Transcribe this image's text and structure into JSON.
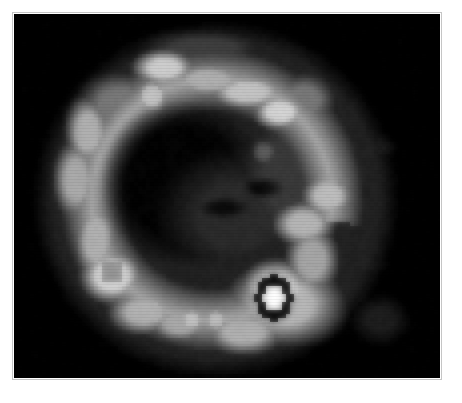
{
  "viewer": {
    "width": 462,
    "height": 403,
    "background_color": "#ffffff",
    "image_area": {
      "x": 14,
      "y": 14,
      "width": 426,
      "height": 364,
      "background_color": "#000000",
      "border_color": "#969696"
    }
  },
  "scan": {
    "modality_appearance": "grayscale nuclear medicine tomographic slice",
    "colormap": "grayscale",
    "pattern": "ring / horseshoe shaped uptake with cold center and focal hotspot",
    "pixelation": "blocky low-resolution interpolation",
    "intensity_levels": {
      "background": "#000000",
      "faint": "#1d1d1d",
      "low": "#3a3a3a",
      "mid": "#6e6e6e",
      "high": "#a9a9a9",
      "bright": "#d2d2d2",
      "peak": "#ffffff",
      "cold_core": "#050505"
    },
    "render": {
      "grid_cols": 107,
      "grid_rows": 91,
      "cell_px": 4,
      "blur_px": 3.2,
      "noise_amplitude": 7
    },
    "field": {
      "comment": "Radial/blob model describing the grayscale intensity field. Values in grid-cell coordinates of a 107x91 sampling grid.",
      "base_level": 0,
      "body_mask": {
        "cx": 50,
        "cy": 46,
        "rx": 41,
        "ry": 40,
        "edge_softness": 5,
        "level": 34
      },
      "ring": {
        "cx": 49,
        "cy": 46,
        "radius": 30,
        "thickness": 9,
        "level": 168,
        "arc_start_deg": 60,
        "arc_end_deg": 430,
        "gap_start_deg": 10,
        "gap_end_deg": 55
      },
      "cold_center": {
        "cx": 42,
        "cy": 42,
        "rx": 21,
        "ry": 21,
        "level": 4
      },
      "blobs": [
        {
          "name": "upper-left-arc",
          "cx": 26,
          "cy": 22,
          "rx": 9,
          "ry": 7,
          "level": 120
        },
        {
          "name": "top-left-bright",
          "cx": 37,
          "cy": 13,
          "rx": 7,
          "ry": 4,
          "level": 205
        },
        {
          "name": "top-small-bright",
          "cx": 34,
          "cy": 20,
          "rx": 4,
          "ry": 4,
          "level": 195
        },
        {
          "name": "top-center-band",
          "cx": 48,
          "cy": 16,
          "rx": 9,
          "ry": 4,
          "level": 175
        },
        {
          "name": "top-right-arc",
          "cx": 58,
          "cy": 19,
          "rx": 9,
          "ry": 4,
          "level": 196
        },
        {
          "name": "top-right-focus",
          "cx": 66,
          "cy": 24,
          "rx": 6,
          "ry": 4,
          "level": 212
        },
        {
          "name": "top-right-spread",
          "cx": 72,
          "cy": 21,
          "rx": 7,
          "ry": 6,
          "level": 120
        },
        {
          "name": "upper-canopy",
          "cx": 47,
          "cy": 8,
          "rx": 14,
          "ry": 4,
          "level": 62
        },
        {
          "name": "left-arc-upper",
          "cx": 18,
          "cy": 29,
          "rx": 5,
          "ry": 8,
          "level": 176
        },
        {
          "name": "left-arc-mid",
          "cx": 15,
          "cy": 41,
          "rx": 5,
          "ry": 9,
          "level": 170
        },
        {
          "name": "left-arc-lower",
          "cx": 20,
          "cy": 56,
          "rx": 5,
          "ry": 9,
          "level": 176
        },
        {
          "name": "left-hot-ring",
          "cx": 24,
          "cy": 65,
          "rx": 7,
          "ry": 6,
          "level": 215
        },
        {
          "name": "left-hot-ring-core",
          "cx": 24,
          "cy": 64,
          "rx": 3,
          "ry": 3,
          "level": 150
        },
        {
          "name": "lower-left-arc",
          "cx": 32,
          "cy": 74,
          "rx": 8,
          "ry": 5,
          "level": 178
        },
        {
          "name": "bottom-left-arc",
          "cx": 41,
          "cy": 77,
          "rx": 7,
          "ry": 4,
          "level": 168
        },
        {
          "name": "bottom-small-1",
          "cx": 44,
          "cy": 76,
          "rx": 3,
          "ry": 3,
          "level": 196
        },
        {
          "name": "bottom-small-2",
          "cx": 50,
          "cy": 76,
          "rx": 3,
          "ry": 3,
          "level": 190
        },
        {
          "name": "bottom-center",
          "cx": 57,
          "cy": 79,
          "rx": 9,
          "ry": 5,
          "level": 176
        },
        {
          "name": "bottom-right-plateau",
          "cx": 67,
          "cy": 72,
          "rx": 13,
          "ry": 9,
          "level": 182
        },
        {
          "name": "hotspot-glow",
          "cx": 65,
          "cy": 69,
          "rx": 8,
          "ry": 7,
          "level": 225
        },
        {
          "name": "right-mid-upper",
          "cx": 78,
          "cy": 45,
          "rx": 6,
          "ry": 5,
          "level": 188
        },
        {
          "name": "right-mid-lower",
          "cx": 72,
          "cy": 52,
          "rx": 7,
          "ry": 5,
          "level": 182
        },
        {
          "name": "right-column",
          "cx": 74,
          "cy": 61,
          "rx": 6,
          "ry": 8,
          "level": 165
        },
        {
          "name": "right-faint-field",
          "cx": 70,
          "cy": 40,
          "rx": 14,
          "ry": 18,
          "level": 58
        },
        {
          "name": "mid-faint-speck",
          "cx": 62,
          "cy": 34,
          "rx": 3,
          "ry": 3,
          "level": 92
        },
        {
          "name": "mid-body-haze",
          "cx": 55,
          "cy": 50,
          "rx": 16,
          "ry": 14,
          "level": 44
        },
        {
          "name": "cold-notch-a",
          "cx": 62,
          "cy": 43,
          "rx": 4,
          "ry": 2,
          "level": -40
        },
        {
          "name": "cold-notch-b",
          "cx": 52,
          "cy": 48,
          "rx": 5,
          "ry": 2,
          "level": -32
        },
        {
          "name": "outer-patch-1",
          "cx": 90,
          "cy": 33,
          "rx": 4,
          "ry": 3,
          "level": 28
        },
        {
          "name": "outer-patch-2",
          "cx": 88,
          "cy": 62,
          "rx": 4,
          "ry": 2,
          "level": 26
        },
        {
          "name": "outer-patch-3",
          "cx": 91,
          "cy": 76,
          "rx": 6,
          "ry": 5,
          "level": 30
        },
        {
          "name": "outer-patch-4",
          "cx": 84,
          "cy": 29,
          "rx": 3,
          "ry": 2,
          "level": 20
        },
        {
          "name": "outer-patch-5",
          "cx": 86,
          "cy": 70,
          "rx": 2,
          "ry": 2,
          "level": 18
        }
      ],
      "hotspot": {
        "name": "focal-hotspot",
        "cx": 64.5,
        "cy": 70.5,
        "rx": 2.6,
        "ry": 3.4,
        "peak_level": 255,
        "dark_halo": {
          "rx": 4.6,
          "ry": 5.6,
          "level": 6
        }
      }
    }
  }
}
